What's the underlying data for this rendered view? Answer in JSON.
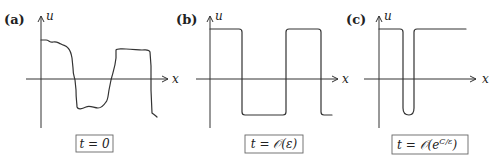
{
  "panels": [
    {
      "id": "a",
      "label": "(a)",
      "y_axis_label": "u",
      "x_axis_label": "x",
      "caption": "t = 0",
      "description": "Initial noisy profile: high plateau, drop to low trough, rise to high plateau, drop again"
    },
    {
      "id": "b",
      "label": "(b)",
      "y_axis_label": "u",
      "x_axis_label": "x",
      "caption": "t = 𝒪(ε)",
      "description": "Sharp square-wave profile with two transition layers per period"
    },
    {
      "id": "c",
      "label": "(c)",
      "y_axis_label": "u",
      "x_axis_label": "x",
      "caption": "t = 𝒪(e^{C/ε})",
      "caption_main": "t = 𝒪(e",
      "caption_sup": "C/ε",
      "caption_end": ")",
      "description": "Single narrow dip remaining; other interfaces coalesced"
    }
  ]
}
